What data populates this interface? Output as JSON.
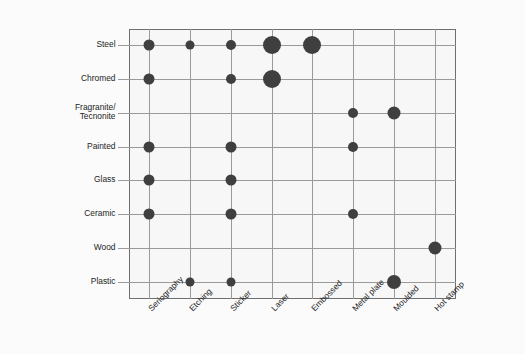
{
  "chart_data": {
    "type": "scatter",
    "subtype": "bubble-matrix",
    "title": "",
    "xlabel": "",
    "ylabel": "",
    "grid": true,
    "legend": "none",
    "x_categories": [
      "Seriography",
      "Etching",
      "Sticker",
      "Laser",
      "Embossed",
      "Metal plate",
      "Moulded",
      "Hot stamp"
    ],
    "y_categories": [
      "Steel",
      "Chromed",
      "Fragranite/\nTecnonite",
      "Painted",
      "Glass",
      "Ceramic",
      "Wood",
      "Plastic"
    ],
    "bubble_color": "#3f3f3f",
    "background_color": "#f7f7f7",
    "grid_color": "#9a9a9a",
    "frame_color": "#6e6e6e",
    "size_scale": {
      "small": 8,
      "medium": 11,
      "large": 14,
      "xlarge": 18
    },
    "points": [
      {
        "y": "Steel",
        "x": "Seriography",
        "size": 11
      },
      {
        "y": "Steel",
        "x": "Etching",
        "size": 9
      },
      {
        "y": "Steel",
        "x": "Sticker",
        "size": 10
      },
      {
        "y": "Steel",
        "x": "Laser",
        "size": 18
      },
      {
        "y": "Steel",
        "x": "Embossed",
        "size": 18
      },
      {
        "y": "Chromed",
        "x": "Seriography",
        "size": 11
      },
      {
        "y": "Chromed",
        "x": "Sticker",
        "size": 10
      },
      {
        "y": "Chromed",
        "x": "Laser",
        "size": 18
      },
      {
        "y": "Fragranite/\nTecnonite",
        "x": "Metal plate",
        "size": 10
      },
      {
        "y": "Fragranite/\nTecnonite",
        "x": "Moulded",
        "size": 13
      },
      {
        "y": "Painted",
        "x": "Seriography",
        "size": 11
      },
      {
        "y": "Painted",
        "x": "Sticker",
        "size": 11
      },
      {
        "y": "Painted",
        "x": "Metal plate",
        "size": 10
      },
      {
        "y": "Glass",
        "x": "Seriography",
        "size": 11
      },
      {
        "y": "Glass",
        "x": "Sticker",
        "size": 11
      },
      {
        "y": "Ceramic",
        "x": "Seriography",
        "size": 11
      },
      {
        "y": "Ceramic",
        "x": "Sticker",
        "size": 11
      },
      {
        "y": "Ceramic",
        "x": "Metal plate",
        "size": 10
      },
      {
        "y": "Wood",
        "x": "Hot stamp",
        "size": 13
      },
      {
        "y": "Plastic",
        "x": "Etching",
        "size": 9
      },
      {
        "y": "Plastic",
        "x": "Sticker",
        "size": 9
      },
      {
        "y": "Plastic",
        "x": "Moulded",
        "size": 14
      }
    ]
  }
}
